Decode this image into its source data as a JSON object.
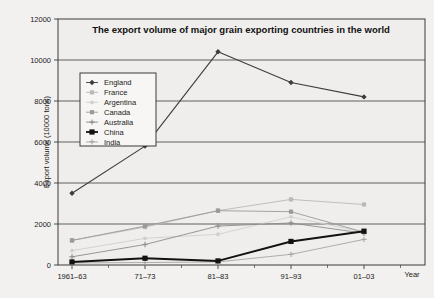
{
  "chart_data": {
    "type": "line",
    "title": "The export volume of major grain exporting countries in the world",
    "xlabel": "Year",
    "ylabel": "Export volume (10000 tons)",
    "categories": [
      "1961–63",
      "71–73",
      "81–83",
      "91–93",
      "01–03"
    ],
    "ylim": [
      0,
      12000
    ],
    "ytick_labels": [
      "0",
      "2000",
      "4000",
      "6000",
      "8000",
      "10000",
      "12000"
    ],
    "ytick_values": [
      0,
      2000,
      4000,
      6000,
      8000,
      10000,
      12000
    ],
    "grid": true,
    "legend_position": "upper-left-inside",
    "series": [
      {
        "name": "England",
        "color": "#3d3d3d",
        "marker": "diamond",
        "width": 1.1,
        "values": [
          3500,
          5800,
          10400,
          8900,
          8200
        ]
      },
      {
        "name": "France",
        "color": "#b9b9b9",
        "marker": "square",
        "width": 0.9,
        "values": [
          1200,
          1850,
          2650,
          3200,
          2950
        ]
      },
      {
        "name": "Argentina",
        "color": "#cfcfcf",
        "marker": "dot",
        "width": 0.9,
        "values": [
          700,
          1300,
          1500,
          2350,
          1600
        ]
      },
      {
        "name": "Canada",
        "color": "#9a9a9a",
        "marker": "square",
        "width": 0.9,
        "values": [
          1200,
          1900,
          2650,
          2600,
          1600
        ]
      },
      {
        "name": "Australia",
        "color": "#8c8c8c",
        "marker": "cross",
        "width": 0.9,
        "values": [
          400,
          1000,
          1900,
          2050,
          1550
        ]
      },
      {
        "name": "China",
        "color": "#121212",
        "marker": "filled-square",
        "width": 2.0,
        "values": [
          150,
          330,
          200,
          1150,
          1650
        ]
      },
      {
        "name": "India",
        "color": "#a5a5a5",
        "marker": "cross",
        "width": 0.9,
        "values": [
          100,
          120,
          150,
          520,
          1250
        ]
      }
    ]
  },
  "axis": {
    "year_label": "Year"
  },
  "legend": {
    "items": [
      "England",
      "France",
      "Argentina",
      "Canada",
      "Australia",
      "China",
      "India"
    ]
  }
}
